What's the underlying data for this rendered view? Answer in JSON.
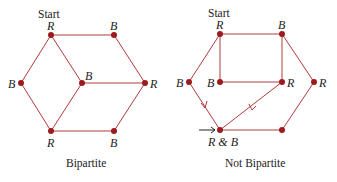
{
  "colors": {
    "edge": "#b03a3a",
    "node": "#9c1b1f",
    "arrow": "#222222",
    "text": "#222222"
  },
  "left_graph": {
    "caption": "Bipartite",
    "start_label": "Start",
    "nodes": [
      {
        "id": "a",
        "x": 51,
        "y": 35,
        "label": "R"
      },
      {
        "id": "b",
        "x": 114,
        "y": 35,
        "label": "B"
      },
      {
        "id": "c",
        "x": 21,
        "y": 83,
        "label": "B"
      },
      {
        "id": "d",
        "x": 82,
        "y": 83,
        "label": "B"
      },
      {
        "id": "e",
        "x": 145,
        "y": 83,
        "label": "R"
      },
      {
        "id": "f",
        "x": 51,
        "y": 131,
        "label": "R"
      },
      {
        "id": "g",
        "x": 114,
        "y": 131,
        "label": "B"
      }
    ],
    "edges": [
      [
        "a",
        "b"
      ],
      [
        "a",
        "c"
      ],
      [
        "a",
        "d"
      ],
      [
        "b",
        "e"
      ],
      [
        "d",
        "e"
      ],
      [
        "c",
        "f"
      ],
      [
        "d",
        "f"
      ],
      [
        "f",
        "g"
      ],
      [
        "g",
        "e"
      ]
    ]
  },
  "right_graph": {
    "caption": "Not Bipartite",
    "start_label": "Start",
    "conflict_label": "R & B",
    "nodes": [
      {
        "id": "a",
        "x": 220,
        "y": 34,
        "label": "R"
      },
      {
        "id": "b",
        "x": 282,
        "y": 34,
        "label": "B"
      },
      {
        "id": "c",
        "x": 189,
        "y": 82,
        "label": "B"
      },
      {
        "id": "d",
        "x": 220,
        "y": 82,
        "label": "B"
      },
      {
        "id": "e",
        "x": 282,
        "y": 82,
        "label": "R"
      },
      {
        "id": "h",
        "x": 314,
        "y": 82,
        "label": "R"
      },
      {
        "id": "f",
        "x": 220,
        "y": 130,
        "label": "R & B"
      },
      {
        "id": "g",
        "x": 282,
        "y": 130,
        "label": ""
      }
    ],
    "edges": [
      [
        "a",
        "b"
      ],
      [
        "a",
        "c"
      ],
      [
        "a",
        "d"
      ],
      [
        "b",
        "e"
      ],
      [
        "d",
        "e"
      ],
      [
        "b",
        "h"
      ],
      [
        "c",
        "f"
      ],
      [
        "e",
        "f"
      ],
      [
        "f",
        "g"
      ],
      [
        "g",
        "h"
      ]
    ]
  }
}
